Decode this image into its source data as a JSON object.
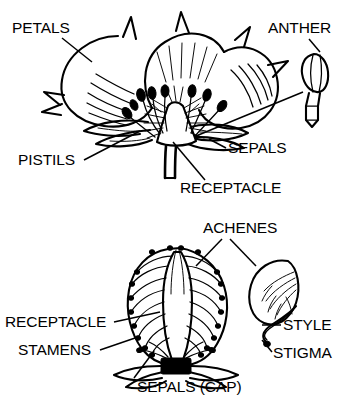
{
  "figure": {
    "ink_color": "#000000",
    "background_color": "#ffffff",
    "style": "black-and-white line drawing"
  },
  "panels": [
    {
      "id": "flower-panel",
      "name": "strawberry-flower-cross-section",
      "description": "Cut-away side view of an open strawberry flower showing petals, sepals, pistils on the receptacle, and stamens",
      "labels": [
        {
          "key": "petals",
          "text": "PETALS",
          "x": 12,
          "y": 33,
          "anchor": "start"
        },
        {
          "key": "pistils",
          "text": "PISTILS",
          "x": 18,
          "y": 165,
          "anchor": "start"
        },
        {
          "key": "anther",
          "text": "ANTHER",
          "x": 268,
          "y": 33,
          "anchor": "start"
        },
        {
          "key": "sepals",
          "text": "SEPALS",
          "x": 228,
          "y": 153,
          "anchor": "start"
        },
        {
          "key": "receptacle",
          "text": "RECEPTACLE",
          "x": 180,
          "y": 193,
          "anchor": "start"
        }
      ],
      "detail_callout": {
        "key": "anther-detail",
        "name": "anther-detail-drawing",
        "description": "Enlarged single anther with oval pollen sac on a tapering filament"
      }
    },
    {
      "id": "fruit-panel",
      "name": "strawberry-fruit-cross-section",
      "description": "Cut-away side view of a strawberry fruit showing the fleshy receptacle, vascular strands leading to achenes, the sepal cap and dried stamens",
      "labels": [
        {
          "key": "achenes",
          "text": "ACHENES",
          "x": 203,
          "y": 233,
          "anchor": "start"
        },
        {
          "key": "receptacle2",
          "text": "RECEPTACLE",
          "x": 5,
          "y": 327,
          "anchor": "start"
        },
        {
          "key": "stamens",
          "text": "STAMENS",
          "x": 18,
          "y": 355,
          "anchor": "start"
        },
        {
          "key": "sepals_cap",
          "text": "SEPALS  (CAP)",
          "x": 137,
          "y": 392,
          "anchor": "start"
        },
        {
          "key": "style",
          "text": "STYLE",
          "x": 283,
          "y": 330,
          "anchor": "start"
        },
        {
          "key": "stigma",
          "text": "STIGMA",
          "x": 273,
          "y": 358,
          "anchor": "start"
        }
      ],
      "detail_callout": {
        "key": "achene-detail",
        "name": "achene-detail-drawing",
        "description": "Enlarged single achene (seed) with internal branching veins, a curved style and a terminal stigma"
      }
    }
  ]
}
